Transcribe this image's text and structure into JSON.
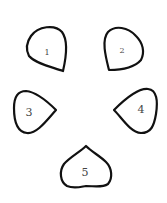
{
  "diagram": {
    "background": "#ffffff",
    "stroke_color": "#111111",
    "label_color": "#444444",
    "shapes": [
      {
        "id": 1,
        "label": "1",
        "pointing": "bottom-right"
      },
      {
        "id": 2,
        "label": "2",
        "pointing": "bottom-left"
      },
      {
        "id": 3,
        "label": "3",
        "pointing": "right"
      },
      {
        "id": 4,
        "label": "4",
        "pointing": "left"
      },
      {
        "id": 5,
        "label": "5",
        "pointing": "up"
      }
    ]
  }
}
